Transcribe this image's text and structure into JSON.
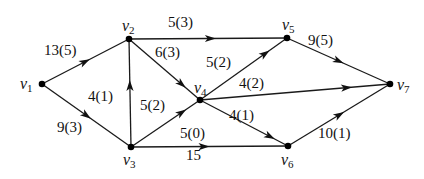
{
  "diagram": {
    "type": "directed-network",
    "nodes": [
      {
        "id": "v1",
        "label": "v",
        "sub": "1"
      },
      {
        "id": "v2",
        "label": "v",
        "sub": "2"
      },
      {
        "id": "v3",
        "label": "v",
        "sub": "3"
      },
      {
        "id": "v4",
        "label": "v",
        "sub": "4"
      },
      {
        "id": "v5",
        "label": "v",
        "sub": "5"
      },
      {
        "id": "v6",
        "label": "v",
        "sub": "6"
      },
      {
        "id": "v7",
        "label": "v",
        "sub": "7"
      }
    ],
    "edges": [
      {
        "from": "v1",
        "to": "v2",
        "label": "13(5)"
      },
      {
        "from": "v1",
        "to": "v3",
        "label": "9(3)"
      },
      {
        "from": "v3",
        "to": "v2",
        "label": "4(1)"
      },
      {
        "from": "v2",
        "to": "v5",
        "label": "5(3)"
      },
      {
        "from": "v2",
        "to": "v4",
        "label": "6(3)"
      },
      {
        "from": "v3",
        "to": "v4",
        "label": "5(2)"
      },
      {
        "from": "v4",
        "to": "v5",
        "label": "5(2)"
      },
      {
        "from": "v4",
        "to": "v7",
        "label": "4(2)"
      },
      {
        "from": "v4",
        "to": "v6",
        "label": "4(1)"
      },
      {
        "from": "v3",
        "to": "v6",
        "label": "5(0)",
        "label2": "15"
      },
      {
        "from": "v5",
        "to": "v7",
        "label": "9(5)"
      },
      {
        "from": "v6",
        "to": "v7",
        "label": "10(1)"
      }
    ]
  }
}
